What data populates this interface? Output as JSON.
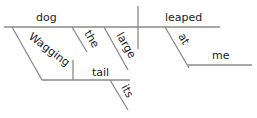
{
  "diagram": {
    "type": "sentence-diagram",
    "words": {
      "subject": "dog",
      "verb": "leaped",
      "participle": "Wagging",
      "participle_object": "tail",
      "object_modifier": "its",
      "article": "the",
      "adjective": "large",
      "preposition": "at",
      "prep_object": "me"
    },
    "line_color": "#8a8a8a",
    "text_color": "#1a1a1a"
  }
}
